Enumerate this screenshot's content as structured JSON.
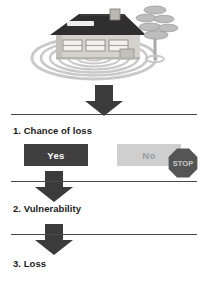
{
  "diagram": {
    "illustration": {
      "name": "house-with-ripples-and-tree",
      "elements": [
        "house",
        "roof",
        "chimney",
        "skylight",
        "windows",
        "door",
        "tree",
        "concentric-rings"
      ]
    },
    "steps": [
      {
        "id": "step-1",
        "label": "1. Chance of loss"
      },
      {
        "id": "step-2",
        "label": "2. Vulnerability"
      },
      {
        "id": "step-3",
        "label": "3. Loss"
      }
    ],
    "choices": [
      {
        "id": "yes",
        "label": "Yes",
        "state": "selected"
      },
      {
        "id": "no",
        "label": "No",
        "state": "disabled"
      }
    ],
    "stop_sign": {
      "label": "STOP"
    },
    "arrows": [
      {
        "id": "arrow-1",
        "direction": "down"
      },
      {
        "id": "arrow-2",
        "direction": "down"
      },
      {
        "id": "arrow-3",
        "direction": "down"
      }
    ],
    "colors": {
      "arrow": "#3b3b3b",
      "rule": "#4a4a4a",
      "yes_bg": "#3f3f3f",
      "yes_text": "#ffffff",
      "no_bg": "#cfcfcf",
      "no_text": "#9b9b9b",
      "stop_bg": "#555555",
      "stop_text": "#c9c9c9",
      "roof": "#2f2f2f",
      "wall": "#d4d2cc",
      "ring": "#c9c9c9",
      "tree": "#b5b5b5",
      "text": "#1a1a1a"
    }
  }
}
